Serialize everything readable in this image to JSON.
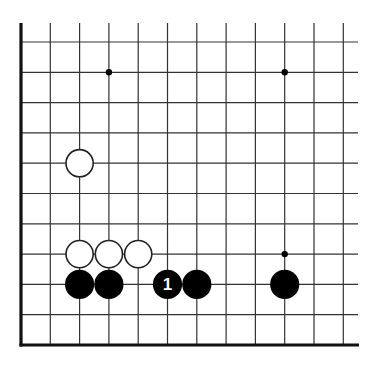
{
  "diagram": {
    "type": "go-board-corner",
    "corner": "bottom-left",
    "colors": {
      "background": "#ffffff",
      "line": "#333333",
      "edge": "#111111",
      "black_stone": "#000000",
      "white_stone": "#ffffff",
      "stone_outline": "#222222",
      "label_on_black": "#ffffff"
    },
    "grid": {
      "columns": 12,
      "rows": 11,
      "origin_x": 21,
      "origin_y": 42,
      "step_x": 29.3,
      "step_y": 30.3,
      "line_top": 23,
      "line_right": 358
    },
    "star_points": [
      {
        "col": 3,
        "row": 1
      },
      {
        "col": 9,
        "row": 1
      },
      {
        "col": 9,
        "row": 7
      }
    ],
    "stones": [
      {
        "color": "white",
        "col": 2,
        "row": 4,
        "label": ""
      },
      {
        "color": "white",
        "col": 2,
        "row": 7,
        "label": ""
      },
      {
        "color": "white",
        "col": 3,
        "row": 7,
        "label": ""
      },
      {
        "color": "white",
        "col": 4,
        "row": 7,
        "label": ""
      },
      {
        "color": "black",
        "col": 2,
        "row": 8,
        "label": ""
      },
      {
        "color": "black",
        "col": 3,
        "row": 8,
        "label": ""
      },
      {
        "color": "black",
        "col": 5,
        "row": 8,
        "label": "1"
      },
      {
        "color": "black",
        "col": 6,
        "row": 8,
        "label": ""
      },
      {
        "color": "black",
        "col": 9,
        "row": 8,
        "label": ""
      }
    ]
  }
}
